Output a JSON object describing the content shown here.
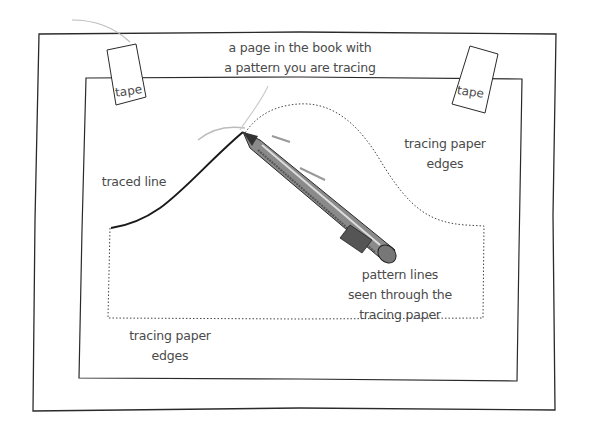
{
  "diagram": {
    "title_lines": [
      "a page in the book with",
      "a pattern you are tracing"
    ],
    "tape_labels": [
      "tape",
      "tape"
    ],
    "tracing_paper_edges_right": [
      "tracing paper",
      "edges"
    ],
    "tracing_paper_edges_bottom": [
      "tracing paper",
      "edges"
    ],
    "traced_line_label": "traced line",
    "pattern_lines_label": [
      "pattern lines",
      "seen through the",
      "tracing paper"
    ],
    "colors": {
      "line": "#2a2a2a",
      "text": "#4a4a4a",
      "pencil_body": "#6b6b6b",
      "background": "#ffffff"
    }
  }
}
